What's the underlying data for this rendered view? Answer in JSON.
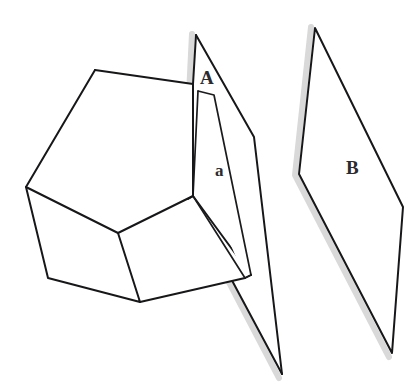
{
  "figure": {
    "background_color": "#ffffff",
    "stroke_color": "#17171a",
    "shadow_color": "#d9d9d9",
    "width": 415,
    "height": 392,
    "labels": {
      "plane_a_upper": "A",
      "cross_section_face": "a",
      "plane_b": "B"
    },
    "elements": {
      "solid_name": "polyhedron",
      "plane_a_name": "cutting-plane-a",
      "plane_b_name": "parallel-plane-b",
      "cross_section_name": "cross-section-face-a"
    },
    "geometry": {
      "polyhedron_top_face": "95,70 193,84 193,196 118,233 26,187",
      "polyhedron_left_face": "26,187 118,233 140,302 48,278",
      "polyhedron_lower_right_face": "118,233 193,196 245,278 140,302",
      "plane_a_outline": "196,35 254,137 282,374 188,196 193,84",
      "plane_a_left_edge": "196,35 193,84 193,196 188,196 282,374",
      "plane_b_outline": "315,28 403,207 392,353 299,174",
      "cross_section_quad": "198,91 214,95 208,192 193,196",
      "cross_section_side": "214,95 251,275 245,278 208,192",
      "shadow_a_path": "196,35 188,196 282,374",
      "shadow_b_path": "315,28 299,174 392,353"
    }
  }
}
